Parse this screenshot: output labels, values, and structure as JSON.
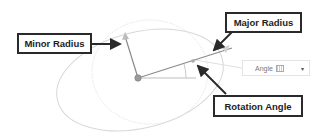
{
  "callouts": {
    "minor_radius": "Minor Radius",
    "major_radius": "Major Radius",
    "rotation_angle": "Rotation Angle"
  },
  "angle_field": {
    "label": "Angle",
    "dropdown_glyph": "▾"
  },
  "colors": {
    "ellipse_stroke": "#d8d8d8",
    "construction_line": "#8a8a8a",
    "callout_border": "#2a2a2a",
    "arrow": "#2a2a2a"
  }
}
